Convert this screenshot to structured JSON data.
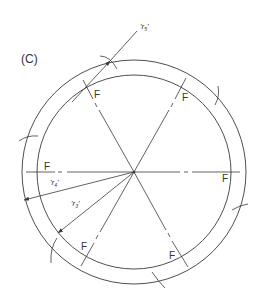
{
  "figure": {
    "label": "(C)",
    "line_color": "#3a3a3a",
    "background": "#ffffff"
  },
  "circles": {
    "outer": {
      "cx": 134,
      "cy": 172,
      "r": 112
    },
    "inner": {
      "cx": 134,
      "cy": 172,
      "r": 97
    }
  },
  "center": {
    "x": 134,
    "y": 172
  },
  "spokes": [
    {
      "angle_deg": 0,
      "label": "F"
    },
    {
      "angle_deg": 60,
      "label": "F"
    },
    {
      "angle_deg": 120,
      "label": "F"
    },
    {
      "angle_deg": 180,
      "label": "F"
    },
    {
      "angle_deg": 240,
      "label": "F"
    },
    {
      "angle_deg": 300,
      "label": "F"
    }
  ],
  "dimensions": {
    "r5": {
      "label": "'r",
      "subscript": "5",
      "close": "'"
    },
    "r4": {
      "label": "'r",
      "subscript": "4",
      "close": "'"
    },
    "r3": {
      "label": "'r",
      "subscript": "3",
      "close": "'"
    }
  },
  "f_labels": {
    "top_left": "F",
    "top_right": "F",
    "left": "F",
    "right": "F",
    "bottom_left": "F",
    "bottom_right": "F"
  }
}
